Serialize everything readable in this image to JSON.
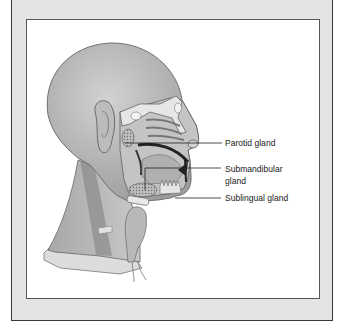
{
  "figure": {
    "labels": [
      {
        "id": "parotid",
        "text": "Parotid gland"
      },
      {
        "id": "submandibular_1",
        "text": "Submandibular"
      },
      {
        "id": "submandibular_2",
        "text": "gland"
      },
      {
        "id": "sublingual",
        "text": "Sublingual gland"
      }
    ]
  },
  "colors": {
    "frame_bg": "#e4e4e4",
    "panel_bg": "#ffffff",
    "skin": "#b5b5b5",
    "line": "#222222"
  }
}
